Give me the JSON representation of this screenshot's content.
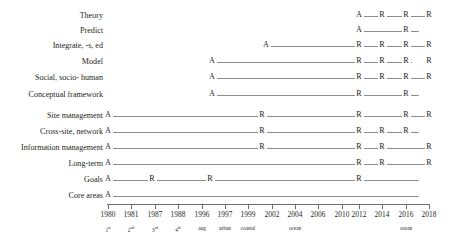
{
  "chart_data": {
    "type": "table",
    "title": "",
    "xlabel": "",
    "ylabel": "",
    "grid": false,
    "legend": "none",
    "marker_legend": {
      "A": "appears / added",
      "R": "reaffirmed / repeated"
    },
    "axis": {
      "ticks": [
        {
          "year": "1980",
          "sub": "1st",
          "sub_base": "1",
          "sub_sup": "st",
          "x": 108
        },
        {
          "year": "1981",
          "sub": "2nd",
          "sub_base": "2",
          "sub_sup": "nd",
          "x": 131
        },
        {
          "year": "1987",
          "sub": "3rd",
          "sub_base": "3",
          "sub_sup": "rd",
          "x": 155
        },
        {
          "year": "1988",
          "sub": "4th",
          "sub_base": "4",
          "sub_sup": "th",
          "x": 178
        },
        {
          "year": "1996",
          "sub": "aug",
          "sub_base": "aug",
          "sub_sup": "",
          "x": 202
        },
        {
          "year": "1997",
          "sub": "urban",
          "sub_base": "urban",
          "sub_sup": "",
          "x": 225
        },
        {
          "year": "1999",
          "sub": "coastal",
          "sub_base": "coastal",
          "sub_sup": "",
          "x": 248
        },
        {
          "year": "2002",
          "sub": "",
          "sub_base": "",
          "sub_sup": "",
          "x": 272
        },
        {
          "year": "2004",
          "sub": "ocean",
          "sub_base": "ocean",
          "sub_sup": "",
          "x": 295
        },
        {
          "year": "2006",
          "sub": "",
          "sub_base": "",
          "sub_sup": "",
          "x": 318
        },
        {
          "year": "2010",
          "sub": "",
          "sub_base": "",
          "sub_sup": "",
          "x": 342
        },
        {
          "year": "2012",
          "sub": "",
          "sub_base": "",
          "sub_sup": "",
          "x": 359
        },
        {
          "year": "2014",
          "sub": "",
          "sub_base": "",
          "sub_sup": "",
          "x": 382
        },
        {
          "year": "2016",
          "sub": "ocean",
          "sub_base": "ocean",
          "sub_sup": "",
          "x": 406
        },
        {
          "year": "2018",
          "sub": "",
          "sub_base": "",
          "sub_sup": "",
          "x": 429
        }
      ]
    },
    "rows": [
      {
        "label": "Theory",
        "y": 16,
        "markers": [
          {
            "type": "A",
            "x": 359
          },
          {
            "type": "R",
            "x": 382
          },
          {
            "type": "R",
            "x": 406
          },
          {
            "type": "R",
            "x": 429
          }
        ],
        "line_start": 359,
        "line_end": 429
      },
      {
        "label": "Predict",
        "y": 31,
        "markers": [
          {
            "type": "A",
            "x": 359
          },
          {
            "type": "R",
            "x": 406
          }
        ],
        "line_start": 359,
        "line_end": 419
      },
      {
        "label": "Integrate, -s, ed",
        "y": 46,
        "markers": [
          {
            "type": "A",
            "x": 266
          },
          {
            "type": "R",
            "x": 359
          },
          {
            "type": "R",
            "x": 382
          },
          {
            "type": "R",
            "x": 406
          },
          {
            "type": "R",
            "x": 429
          }
        ],
        "line_start": 266,
        "line_end": 429
      },
      {
        "label": "Model",
        "y": 62,
        "markers": [
          {
            "type": "A",
            "x": 212
          },
          {
            "type": "R",
            "x": 359
          },
          {
            "type": "R",
            "x": 382
          },
          {
            "type": "R",
            "x": 406
          },
          {
            "type": "R",
            "x": 429
          }
        ],
        "line_start": 212,
        "line_end": 412
      },
      {
        "label": "Social, socio- human",
        "y": 78,
        "markers": [
          {
            "type": "A",
            "x": 212
          },
          {
            "type": "R",
            "x": 359
          },
          {
            "type": "R",
            "x": 382
          },
          {
            "type": "R",
            "x": 406
          },
          {
            "type": "R",
            "x": 429
          }
        ],
        "line_start": 212,
        "line_end": 429
      },
      {
        "label": "Conceptual framework",
        "y": 95,
        "markers": [
          {
            "type": "A",
            "x": 212
          },
          {
            "type": "R",
            "x": 359
          },
          {
            "type": "R",
            "x": 406
          }
        ],
        "line_start": 212,
        "line_end": 419
      },
      {
        "label": "Site management",
        "y": 116,
        "markers": [
          {
            "type": "A",
            "x": 108
          },
          {
            "type": "R",
            "x": 262
          },
          {
            "type": "R",
            "x": 359
          },
          {
            "type": "R",
            "x": 406
          },
          {
            "type": "R",
            "x": 429
          }
        ],
        "line_start": 108,
        "line_end": 429
      },
      {
        "label": "Cross-site, network",
        "y": 132,
        "markers": [
          {
            "type": "A",
            "x": 108
          },
          {
            "type": "R",
            "x": 262
          },
          {
            "type": "R",
            "x": 359
          },
          {
            "type": "R",
            "x": 382
          },
          {
            "type": "R",
            "x": 406
          }
        ],
        "line_start": 108,
        "line_end": 419
      },
      {
        "label": "Information management",
        "y": 148,
        "markers": [
          {
            "type": "A",
            "x": 108
          },
          {
            "type": "R",
            "x": 262
          },
          {
            "type": "R",
            "x": 359
          },
          {
            "type": "R",
            "x": 382
          },
          {
            "type": "R",
            "x": 429
          }
        ],
        "line_start": 108,
        "line_end": 429
      },
      {
        "label": "Long-term",
        "y": 164,
        "markers": [
          {
            "type": "A",
            "x": 108
          },
          {
            "type": "R",
            "x": 359
          },
          {
            "type": "R",
            "x": 382
          },
          {
            "type": "R",
            "x": 429
          }
        ],
        "line_start": 108,
        "line_end": 429
      },
      {
        "label": "Goals",
        "y": 180,
        "markers": [
          {
            "type": "A",
            "x": 108
          },
          {
            "type": "R",
            "x": 152
          },
          {
            "type": "R",
            "x": 210
          },
          {
            "type": "R",
            "x": 359
          }
        ],
        "line_start": 108,
        "line_end": 419
      },
      {
        "label": "Core areas",
        "y": 196,
        "markers": [
          {
            "type": "A",
            "x": 108
          }
        ],
        "line_start": 108,
        "line_end": 419
      }
    ]
  }
}
